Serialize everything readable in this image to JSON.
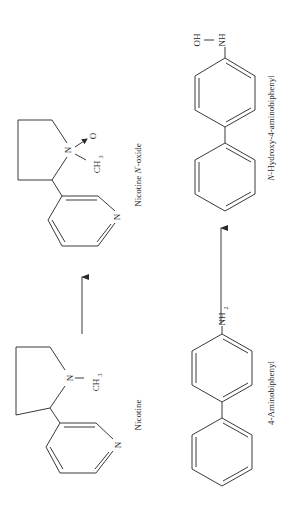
{
  "figure": {
    "orientation": "rotated 90° counter-clockwise",
    "reactions": [
      {
        "substrate": {
          "name": "Nicotine",
          "atoms": {
            "amine_n": "N",
            "methyl": "CH",
            "methyl_sub": "3",
            "pyridine_n": "N"
          }
        },
        "product": {
          "name_prefix": "Nicotine ",
          "name_italic": "N",
          "name_prime": "′",
          "name_suffix": "-oxide",
          "atoms": {
            "amine_n": "N",
            "oxide_o": "O",
            "methyl": "CH",
            "methyl_sub": "3",
            "pyridine_n": "N"
          }
        },
        "arrow": "reaction-arrow"
      },
      {
        "substrate": {
          "name": "4-Aminobiphenyl",
          "atoms": {
            "amine": "NH",
            "amine_sub": "2"
          }
        },
        "product": {
          "name_italic": "N",
          "name_suffix": "-Hydroxy-4-aminobiphenyl",
          "atoms": {
            "hydroxyl": "OH",
            "amine": "NH"
          }
        },
        "arrow": "reaction-arrow"
      }
    ]
  }
}
